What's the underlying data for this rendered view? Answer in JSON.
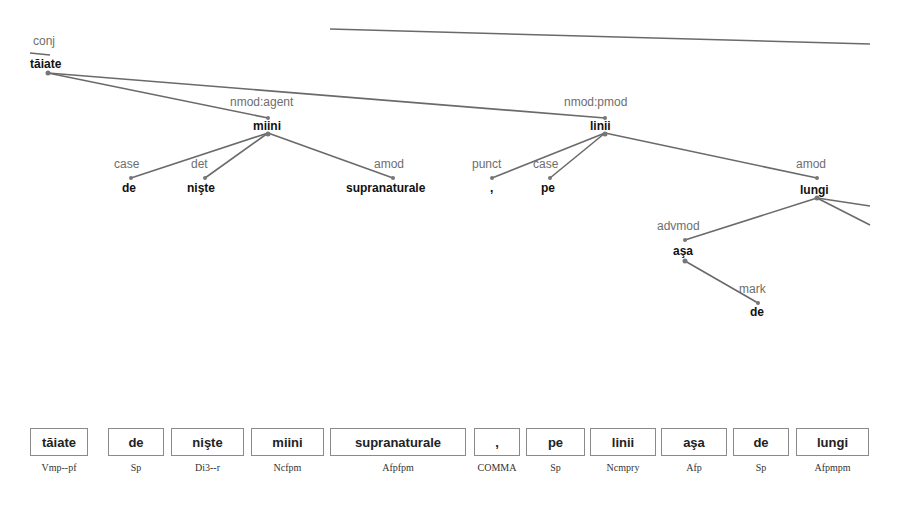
{
  "tree": {
    "nodes": [
      {
        "id": "taiate",
        "word": "tăiate",
        "rel": "conj",
        "x": 48,
        "y": 64,
        "wx": 30,
        "wy": 68,
        "rx": 34,
        "ry": 45
      },
      {
        "id": "miini",
        "word": "miini",
        "rel": "nmod:agent",
        "x": 268,
        "y": 133,
        "wx": 268,
        "wy": 130,
        "rx": 270,
        "ry": 106
      },
      {
        "id": "de1",
        "word": "de",
        "rel": "case",
        "x": 131,
        "y": 178,
        "wx": 131,
        "wy": 192,
        "rx": 131,
        "ry": 168
      },
      {
        "id": "niste",
        "word": "nişte",
        "rel": "det",
        "x": 205,
        "y": 178,
        "wx": 203,
        "wy": 192,
        "rx": 203,
        "ry": 168
      },
      {
        "id": "supranaturale",
        "word": "supranaturale",
        "rel": "amod",
        "x": 393,
        "y": 178,
        "wx": 392,
        "wy": 192,
        "rx": 393,
        "ry": 168
      },
      {
        "id": "linii",
        "word": "linii",
        "rel": "nmod:pmod",
        "x": 605,
        "y": 133,
        "wx": 604,
        "wy": 130,
        "rx": 604,
        "ry": 106
      },
      {
        "id": "comma",
        "word": ",",
        "rel": "punct",
        "x": 492,
        "y": 178,
        "wx": 492,
        "wy": 192,
        "rx": 492,
        "ry": 168
      },
      {
        "id": "pe",
        "word": "pe",
        "rel": "case",
        "x": 550,
        "y": 178,
        "wx": 549,
        "wy": 192,
        "rx": 549,
        "ry": 168
      },
      {
        "id": "lungi",
        "word": "lungi",
        "rel": "amod",
        "x": 817,
        "y": 198,
        "wx": 816,
        "wy": 194,
        "rx": 816,
        "ry": 168
      },
      {
        "id": "asa",
        "word": "aşa",
        "rel": "advmod",
        "x": 685,
        "y": 261,
        "wx": 684,
        "wy": 254,
        "rx": 680,
        "ry": 230
      },
      {
        "id": "de2",
        "word": "de",
        "rel": "mark",
        "x": 758,
        "y": 303,
        "wx": 758,
        "wy": 316,
        "rx": 758,
        "ry": 293
      }
    ]
  },
  "tokens": [
    {
      "word": "tăiate",
      "pos": "Vmp--pf",
      "x": 30,
      "w": 58
    },
    {
      "word": "de",
      "pos": "Sp",
      "x": 108,
      "w": 56
    },
    {
      "word": "nişte",
      "pos": "Di3--r",
      "x": 171,
      "w": 73
    },
    {
      "word": "miini",
      "pos": "Ncfpm",
      "x": 251,
      "w": 73
    },
    {
      "word": "supranaturale",
      "pos": "Afpfpm",
      "x": 330,
      "w": 136
    },
    {
      "word": ",",
      "pos": "COMMA",
      "x": 474,
      "w": 46
    },
    {
      "word": "pe",
      "pos": "Sp",
      "x": 526,
      "w": 59
    },
    {
      "word": "linii",
      "pos": "Ncmpry",
      "x": 590,
      "w": 66
    },
    {
      "word": "aşa",
      "pos": "Afp",
      "x": 661,
      "w": 66
    },
    {
      "word": "de",
      "pos": "Sp",
      "x": 733,
      "w": 56
    },
    {
      "word": "lungi",
      "pos": "Afpmpm",
      "x": 796,
      "w": 73
    }
  ]
}
